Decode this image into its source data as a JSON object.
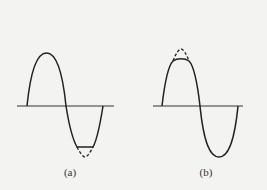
{
  "figure": {
    "background": "#f3f3f1",
    "stroke_color": "#222222",
    "panels": [
      {
        "id": "a",
        "caption": "(a)",
        "description": "Sine wave with negative half-cycle clipped; dashed line shows the removed portion of the trough",
        "clipped_half": "negative"
      },
      {
        "id": "b",
        "caption": "(b)",
        "description": "Sine wave with positive half-cycle clipped; dashed line shows the removed portion of the peak",
        "clipped_half": "positive"
      }
    ]
  }
}
